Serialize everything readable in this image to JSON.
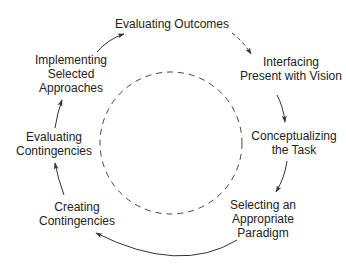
{
  "diagram": {
    "type": "cycle",
    "colors": {
      "text": "#222222",
      "stroke": "#333333",
      "background": "#ffffff"
    },
    "center_circle": {
      "style": "dashed"
    },
    "nodes": [
      {
        "id": "evaluating-outcomes",
        "lines": [
          "Evaluating Outcomes"
        ]
      },
      {
        "id": "interfacing-present-with-vision",
        "lines": [
          "Interfacing",
          "Present with Vision"
        ]
      },
      {
        "id": "conceptualizing-the-task",
        "lines": [
          "Conceptualizing",
          "the Task"
        ]
      },
      {
        "id": "selecting-an-appropriate-paradigm",
        "lines": [
          "Selecting an",
          "Appropriate",
          "Paradigm"
        ]
      },
      {
        "id": "creating-contingencies",
        "lines": [
          "Creating",
          "Contingencies"
        ]
      },
      {
        "id": "evaluating-contingencies",
        "lines": [
          "Evaluating",
          "Contingencies"
        ]
      },
      {
        "id": "implementing-selected-approaches",
        "lines": [
          "Implementing",
          "Selected",
          "Approaches"
        ]
      }
    ],
    "edges": [
      {
        "from": "evaluating-outcomes",
        "to": "interfacing-present-with-vision",
        "style": "dashed"
      },
      {
        "from": "interfacing-present-with-vision",
        "to": "conceptualizing-the-task",
        "style": "solid"
      },
      {
        "from": "conceptualizing-the-task",
        "to": "selecting-an-appropriate-paradigm",
        "style": "solid"
      },
      {
        "from": "selecting-an-appropriate-paradigm",
        "to": "creating-contingencies",
        "style": "solid"
      },
      {
        "from": "creating-contingencies",
        "to": "evaluating-contingencies",
        "style": "solid"
      },
      {
        "from": "evaluating-contingencies",
        "to": "implementing-selected-approaches",
        "style": "solid"
      },
      {
        "from": "implementing-selected-approaches",
        "to": "evaluating-outcomes",
        "style": "solid"
      }
    ]
  }
}
